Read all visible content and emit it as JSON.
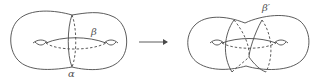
{
  "diagram": {
    "left_surface": {
      "description": "genus-2 surface with curves alpha and beta",
      "labels": {
        "beta": "β",
        "alpha": "α"
      }
    },
    "arrow": {
      "direction": "right"
    },
    "right_surface": {
      "description": "genus-2 surface with twisted curve beta-prime",
      "labels": {
        "beta_prime": "β′"
      }
    },
    "colors": {
      "stroke": "#4a4a4a",
      "background": "#ffffff"
    }
  }
}
